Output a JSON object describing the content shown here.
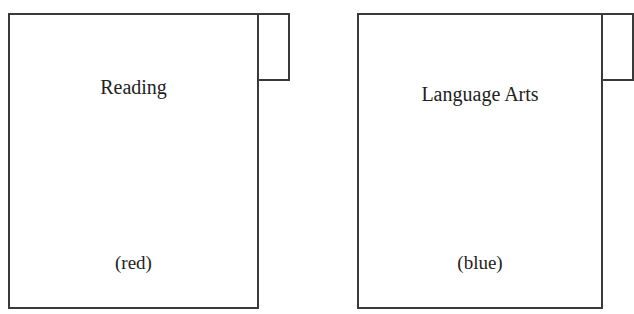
{
  "folders": [
    {
      "label": "Reading",
      "color_note": "(red)"
    },
    {
      "label": "Language Arts",
      "color_note": "(blue)"
    }
  ]
}
